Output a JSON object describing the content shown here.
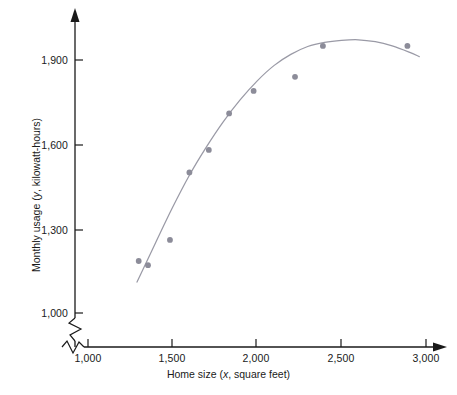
{
  "chart_data": {
    "type": "scatter",
    "title": "",
    "xlabel": "Home size (x, square feet)",
    "ylabel": "Monthly usage (y, kilowatt-hours)",
    "xlabel_prefix": "Home size (",
    "xlabel_var": "x",
    "xlabel_suffix": ", square feet)",
    "ylabel_prefix": "Monthly usage (",
    "ylabel_var": "y",
    "ylabel_suffix": ", kilowatt-hours)",
    "xlim": [
      1000,
      3000
    ],
    "ylim": [
      1000,
      2000
    ],
    "xticks": [
      1000,
      1500,
      2000,
      2500,
      3000
    ],
    "xtick_labels": [
      "1,000",
      "1,500",
      "2,000",
      "2,500",
      "3,000"
    ],
    "yticks": [
      1000,
      1300,
      1600,
      1900
    ],
    "ytick_labels": [
      "1,000",
      "1,300",
      "1,600",
      "1,900"
    ],
    "grid": false,
    "legend": null,
    "axis_break_x": true,
    "axis_break_y": true,
    "point_color": "#8c8c99",
    "curve_color": "#9a9aa6",
    "axis_color": "#1a1a1a",
    "points": [
      {
        "x": 1300,
        "y": 1185
      },
      {
        "x": 1355,
        "y": 1170
      },
      {
        "x": 1485,
        "y": 1260
      },
      {
        "x": 1600,
        "y": 1500
      },
      {
        "x": 1715,
        "y": 1580
      },
      {
        "x": 1835,
        "y": 1710
      },
      {
        "x": 1980,
        "y": 1790
      },
      {
        "x": 2225,
        "y": 1840
      },
      {
        "x": 2390,
        "y": 1950
      },
      {
        "x": 2890,
        "y": 1950
      }
    ],
    "fit_curve": {
      "name": "quadratic fit",
      "x_start": 1290,
      "x_end": 2960,
      "points": [
        {
          "x": 1290,
          "y": 1110
        },
        {
          "x": 1400,
          "y": 1250
        },
        {
          "x": 1500,
          "y": 1375
        },
        {
          "x": 1600,
          "y": 1490
        },
        {
          "x": 1700,
          "y": 1590
        },
        {
          "x": 1800,
          "y": 1680
        },
        {
          "x": 1900,
          "y": 1758
        },
        {
          "x": 2000,
          "y": 1825
        },
        {
          "x": 2100,
          "y": 1880
        },
        {
          "x": 2200,
          "y": 1920
        },
        {
          "x": 2300,
          "y": 1948
        },
        {
          "x": 2400,
          "y": 1963
        },
        {
          "x": 2500,
          "y": 1970
        },
        {
          "x": 2600,
          "y": 1972
        },
        {
          "x": 2700,
          "y": 1965
        },
        {
          "x": 2800,
          "y": 1950
        },
        {
          "x": 2900,
          "y": 1928
        },
        {
          "x": 2960,
          "y": 1912
        }
      ]
    }
  }
}
